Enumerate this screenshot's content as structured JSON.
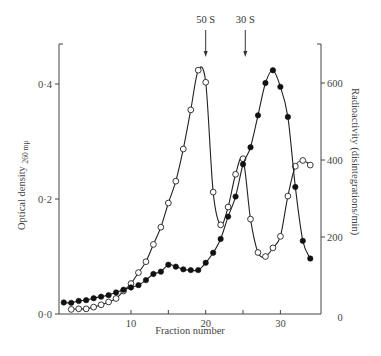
{
  "chart_data": {
    "type": "line",
    "title": "",
    "xlabel": "Fraction number",
    "ylabel": "Optical density 260 mμ",
    "ylabel_main": "Optical density",
    "ylabel_sub": "260 mμ",
    "y2label": "Radioactivity  (disintegrations/min)",
    "xlim": [
      0,
      35
    ],
    "ylim": [
      0,
      0.47
    ],
    "y2lim": [
      0,
      700
    ],
    "x_ticks": [
      10,
      15,
      20,
      25,
      30
    ],
    "x_tick_labels": [
      "10",
      "20",
      "30"
    ],
    "y_ticks": [
      0.0,
      0.2,
      0.4
    ],
    "y_tick_labels": [
      "0·0",
      "0·2",
      "0·4"
    ],
    "y2_ticks": [
      0,
      200,
      400,
      600
    ],
    "y2_tick_labels": [
      "0",
      "200",
      "400",
      "600"
    ],
    "grid": false,
    "legend": null,
    "annotations": [
      {
        "text": "50 S",
        "x": 20,
        "type": "arrow-down"
      },
      {
        "text": "30 S",
        "x": 25.3,
        "type": "arrow-down"
      }
    ],
    "series": [
      {
        "name": "Optical density 260 mμ (open circles)",
        "axis": "left",
        "marker": "open-circle",
        "x": [
          2,
          3,
          4,
          5,
          6,
          7,
          8,
          9,
          10,
          11,
          12,
          13,
          14,
          15,
          16,
          17,
          18,
          19,
          20,
          21,
          22,
          23,
          24,
          25,
          26,
          27,
          28,
          29,
          30,
          31,
          32,
          33,
          34
        ],
        "values": [
          0.008,
          0.009,
          0.009,
          0.012,
          0.016,
          0.021,
          0.027,
          0.04,
          0.053,
          0.072,
          0.091,
          0.121,
          0.151,
          0.193,
          0.231,
          0.287,
          0.355,
          0.424,
          0.403,
          0.212,
          0.155,
          0.186,
          0.243,
          0.27,
          0.165,
          0.107,
          0.1,
          0.115,
          0.135,
          0.205,
          0.257,
          0.267,
          0.259
        ]
      },
      {
        "name": "Radioactivity (filled circles)",
        "axis": "right",
        "marker": "filled-circle",
        "x": [
          1,
          2,
          3,
          4,
          5,
          6,
          7,
          8,
          9,
          10,
          11,
          12,
          13,
          14,
          15,
          16,
          17,
          18,
          19,
          20,
          21,
          22,
          23,
          24,
          25,
          26,
          27,
          28,
          29,
          30,
          31,
          32,
          33,
          34
        ],
        "values": [
          30,
          29,
          34,
          36,
          41,
          45,
          49,
          56,
          63,
          69,
          75,
          88,
          104,
          110,
          128,
          123,
          116,
          114,
          114,
          133,
          159,
          195,
          253,
          305,
          389,
          433,
          516,
          600,
          633,
          590,
          512,
          330,
          190,
          144
        ]
      }
    ]
  }
}
